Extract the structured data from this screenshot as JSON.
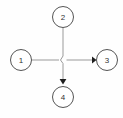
{
  "diagram": {
    "type": "node-link-cross",
    "canvas": {
      "width": 123,
      "height": 118
    },
    "colors": {
      "background": "#fefefe",
      "node_stroke": "#555555",
      "node_fill": "#ffffff",
      "label_text": "#333333",
      "edge_line": "#9a9a9a",
      "arrowhead": "#1f1f1f"
    },
    "nodes": [
      {
        "id": "node-1",
        "label": "1",
        "position": "left",
        "cx": 21,
        "cy": 60,
        "r": 10.5
      },
      {
        "id": "node-2",
        "label": "2",
        "position": "top",
        "cx": 63,
        "cy": 17,
        "r": 10.5
      },
      {
        "id": "node-3",
        "label": "3",
        "position": "right",
        "cx": 107,
        "cy": 60,
        "r": 10.5
      },
      {
        "id": "node-4",
        "label": "4",
        "position": "bottom",
        "cx": 63,
        "cy": 97,
        "r": 10.5
      }
    ],
    "edges": [
      {
        "id": "edge-1-to-3",
        "from": "node-1",
        "to": "node-3",
        "orientation": "horizontal",
        "arrow": "to-node-3",
        "has_crossover_hop": true
      },
      {
        "id": "edge-2-to-4",
        "from": "node-2",
        "to": "node-4",
        "orientation": "vertical",
        "arrow": "to-node-4",
        "has_crossover_hop": true
      }
    ],
    "crossing": {
      "x": 63,
      "y": 60,
      "style": "jog"
    }
  }
}
